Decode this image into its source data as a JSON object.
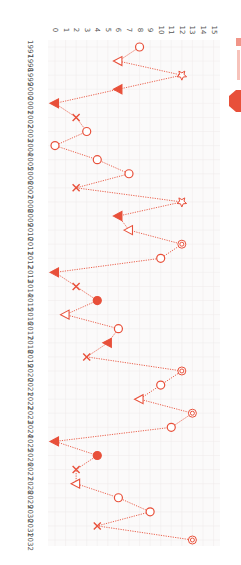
{
  "chart_data": {
    "type": "line",
    "orientation": "rotated-90-clockwise",
    "title": "",
    "xlabel": "Year",
    "ylabel": "",
    "ylim": [
      0,
      15
    ],
    "y_ticks": [
      0,
      1,
      2,
      3,
      4,
      5,
      6,
      7,
      8,
      9,
      10,
      11,
      12,
      13,
      14,
      15
    ],
    "x": [
      1997,
      1998,
      1999,
      2000,
      2001,
      2002,
      2003,
      2004,
      2005,
      2006,
      2007,
      2008,
      2009,
      2010,
      2011,
      2012,
      2013,
      2014,
      2015,
      2016,
      2017,
      2018,
      2019,
      2020,
      2021,
      2022,
      2023,
      2024,
      2025,
      2026,
      2027,
      2028,
      2029,
      2030,
      2031,
      2032
    ],
    "series": [
      {
        "name": "series",
        "color": "#e8503a",
        "line_style": "dotted",
        "values": [
          8,
          6,
          12,
          6,
          0,
          2,
          3,
          0,
          4,
          7,
          2,
          12,
          6,
          7,
          12,
          10,
          0,
          2,
          4,
          1,
          6,
          5,
          3,
          12,
          10,
          8,
          13,
          11,
          0,
          4,
          2,
          2,
          6,
          9,
          4,
          13
        ],
        "markers": [
          "circle-open",
          "triangle-open",
          "star-open",
          "triangle-filled",
          "triangle-filled",
          "x",
          "circle-open",
          "circle-open",
          "circle-open",
          "circle-open",
          "x",
          "star-open",
          "triangle-filled",
          "triangle-open",
          "target",
          "circle-open",
          "triangle-filled",
          "x",
          "circle-filled",
          "triangle-open",
          "circle-open",
          "triangle-filled",
          "x",
          "target",
          "circle-open",
          "triangle-open",
          "target",
          "circle-open",
          "triangle-filled",
          "circle-filled",
          "x",
          "triangle-open",
          "circle-open",
          "circle-open",
          "x",
          "target"
        ]
      }
    ],
    "grid": true,
    "legend": {
      "position": "top-right (cut off)",
      "icon": "octagon-icon"
    }
  },
  "legend": {
    "icon_color": "#e8503a"
  }
}
